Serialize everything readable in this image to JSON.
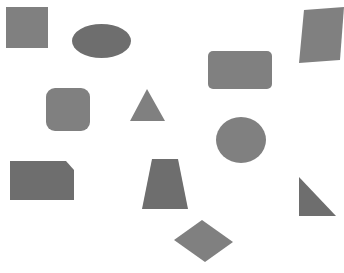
{
  "canvas": {
    "width": 344,
    "height": 273,
    "background_color": "#ffffff",
    "title": "Geometric shapes scatter"
  },
  "style": {
    "shape_fill": "#808080",
    "shape_fill_dark": "#6e6e6e",
    "shape_stroke": "none"
  },
  "shapes": [
    {
      "id": "square",
      "label": "Square",
      "kind": "rect",
      "fill": "#808080",
      "x": 6,
      "y": 7,
      "width": 42,
      "height": 41,
      "rx": 0
    },
    {
      "id": "ellipse",
      "label": "Ellipse",
      "kind": "ellipse",
      "fill": "#6e6e6e",
      "cx": 101.5,
      "cy": 41,
      "rx": 29.5,
      "ry": 17
    },
    {
      "id": "parallelogram",
      "label": "Parallelogram",
      "kind": "polygon",
      "fill": "#808080",
      "points": "304,10 344,7 340,60 299,63"
    },
    {
      "id": "rounded-rectangle",
      "label": "Rounded rectangle",
      "kind": "rect",
      "fill": "#808080",
      "x": 208,
      "y": 51,
      "width": 64,
      "height": 38,
      "rx": 5
    },
    {
      "id": "rounded-square",
      "label": "Rounded square",
      "kind": "rect",
      "fill": "#808080",
      "x": 46,
      "y": 88,
      "width": 44,
      "height": 43,
      "rx": 9
    },
    {
      "id": "triangle",
      "label": "Triangle",
      "kind": "polygon",
      "fill": "#808080",
      "points": "147,89 165,121 130,121"
    },
    {
      "id": "circle",
      "label": "Circle",
      "kind": "ellipse",
      "fill": "#808080",
      "cx": 241,
      "cy": 140,
      "rx": 25,
      "ry": 23
    },
    {
      "id": "chamfered-rectangle",
      "label": "Chamfered rectangle",
      "kind": "polygon",
      "fill": "#6e6e6e",
      "points": "10,161 66,161 74,170 74,200 10,200"
    },
    {
      "id": "trapezoid",
      "label": "Trapezoid",
      "kind": "polygon",
      "fill": "#6e6e6e",
      "points": "152,159 178,159 188,209 142,209"
    },
    {
      "id": "right-triangle",
      "label": "Right triangle",
      "kind": "polygon",
      "fill": "#6e6e6e",
      "points": "299,177 336,216 299,216"
    },
    {
      "id": "diamond",
      "label": "Diamond",
      "kind": "polygon",
      "fill": "#808080",
      "points": "202,220 233,242 205,262 174,240"
    }
  ]
}
